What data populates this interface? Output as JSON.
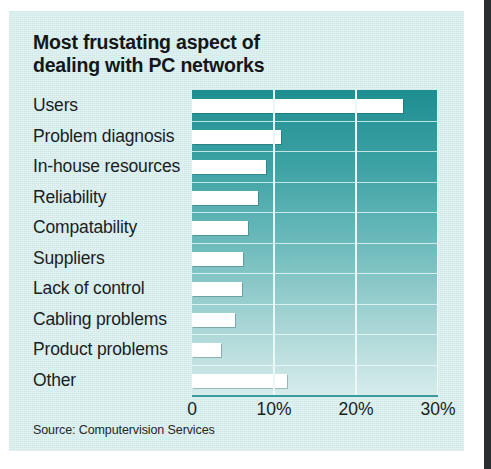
{
  "figure": {
    "title_lines": [
      "Most frustating aspect of",
      "dealing with PC networks"
    ],
    "source": "Source: Computervision Services",
    "colors": {
      "card_background": "#cfe8e8",
      "plot_top": "#1e8e91",
      "plot_bottom": "#d7ecec",
      "bar": "#ffffff",
      "gridline": "#eef7f7",
      "text": "#1b1d1f"
    }
  },
  "chart_data": {
    "type": "bar",
    "orientation": "horizontal",
    "title": "Most frustating aspect of dealing with PC networks",
    "xlabel": "",
    "ylabel": "",
    "xlim": [
      0,
      30
    ],
    "xticks": [
      0,
      10,
      20,
      30
    ],
    "xticklabels": [
      "0",
      "10%",
      "20%",
      "30%"
    ],
    "grid": "vertical",
    "legend": "none",
    "categories": [
      "Users",
      "Problem diagnosis",
      "In-house resources",
      "Reliability",
      "Compatability",
      "Suppliers",
      "Lack of control",
      "Cabling problems",
      "Product problems",
      "Other"
    ],
    "values": [
      25.7,
      10.8,
      9.0,
      8.1,
      6.8,
      6.2,
      6.1,
      5.2,
      3.5,
      11.6
    ],
    "value_unit": "%"
  }
}
